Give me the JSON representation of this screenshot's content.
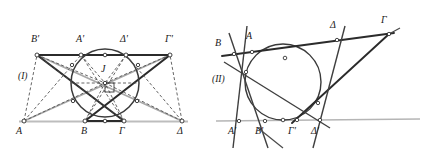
{
  "figure_set": {
    "caption_style": "italic-serif",
    "background_color": "#ffffff",
    "stroke_colors": {
      "dark": "#2b2b2b",
      "mid": "#555555",
      "gray": "#a8a8a8",
      "light_gray": "#bdbdbd",
      "dashed": "#4a4a4a",
      "circle": "#3a3a3a",
      "marker_fill": "#ffffff"
    }
  },
  "figures": [
    {
      "id": "figure-1",
      "number_label": "(I)",
      "number_label_pos": {
        "x": 18,
        "y": 77
      },
      "description": "Crossed trapezoid with inscribed circle, center J, right-angle marker",
      "center_point": {
        "label": "J",
        "label_pos": {
          "x": 101,
          "y": 69
        },
        "x": 105,
        "y": 83
      },
      "circle": {
        "cx": 105,
        "cy": 83,
        "r": 34
      },
      "top_line": {
        "x1": 31,
        "y1": 55,
        "x2": 176,
        "y2": 55
      },
      "bottom_line": {
        "x1": 19,
        "y1": 121,
        "x2": 188,
        "y2": 121
      },
      "vertices": [
        {
          "label": "B'",
          "x": 37,
          "y": 55,
          "label_pos": {
            "x": 31,
            "y": 40
          }
        },
        {
          "label": "A'",
          "x": 81,
          "y": 55,
          "label_pos": {
            "x": 76,
            "y": 40
          }
        },
        {
          "label": "Δ'",
          "x": 126,
          "y": 55,
          "label_pos": {
            "x": 120,
            "y": 40
          }
        },
        {
          "label": "Γ'",
          "x": 170,
          "y": 55,
          "label_pos": {
            "x": 165,
            "y": 40
          }
        },
        {
          "label": "A",
          "x": 24,
          "y": 121,
          "label_pos": {
            "x": 17,
            "y": 127
          }
        },
        {
          "label": "B",
          "x": 85,
          "y": 121,
          "label_pos": {
            "x": 81,
            "y": 127
          }
        },
        {
          "label": "Γ",
          "x": 124,
          "y": 121,
          "label_pos": {
            "x": 119,
            "y": 127
          }
        },
        {
          "label": "Δ",
          "x": 182,
          "y": 121,
          "label_pos": {
            "x": 177,
            "y": 127
          }
        }
      ]
    },
    {
      "id": "figure-2",
      "number_label": "(II)",
      "number_label_pos": {
        "x": 213,
        "y": 80
      },
      "description": "Circle with transversal line and four cevian tangent lines meeting baseline",
      "circle": {
        "cx": 283,
        "cy": 82,
        "r": 38
      },
      "baseline": {
        "x1": 216,
        "y1": 121,
        "x2": 420,
        "y2": 119
      },
      "transversal": {
        "x1": 222,
        "y1": 55,
        "x2": 392,
        "y2": 33
      },
      "vertices": [
        {
          "label": "B",
          "x": 234,
          "y": 54,
          "label_pos": {
            "x": 216,
            "y": 43
          }
        },
        {
          "label": "A",
          "x": 253,
          "y": 51,
          "label_pos": {
            "x": 246,
            "y": 36
          }
        },
        {
          "label": "Δ",
          "x": 337,
          "y": 40,
          "label_pos": {
            "x": 330,
            "y": 25
          }
        },
        {
          "label": "Γ",
          "x": 388,
          "y": 34,
          "label_pos": {
            "x": 381,
            "y": 20
          }
        },
        {
          "label": "A'",
          "x": 239,
          "y": 121,
          "label_pos": {
            "x": 229,
            "y": 130
          }
        },
        {
          "label": "B'",
          "x": 265,
          "y": 121,
          "label_pos": {
            "x": 256,
            "y": 130
          }
        },
        {
          "label": "Γ'",
          "x": 297,
          "y": 120,
          "label_pos": {
            "x": 289,
            "y": 130
          }
        },
        {
          "label": "Δ'",
          "x": 320,
          "y": 120,
          "label_pos": {
            "x": 312,
            "y": 130
          }
        }
      ]
    }
  ]
}
